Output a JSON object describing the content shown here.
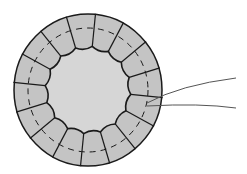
{
  "diagram": {
    "colors": {
      "background": "#ffffff",
      "cell_fill": "#c4c4c4",
      "lumen_fill": "#d6d6d6",
      "outline": "#1a1a1a",
      "leader_line": "#555555"
    },
    "cell_count": 16,
    "labels": [],
    "leader_lines": 2
  }
}
